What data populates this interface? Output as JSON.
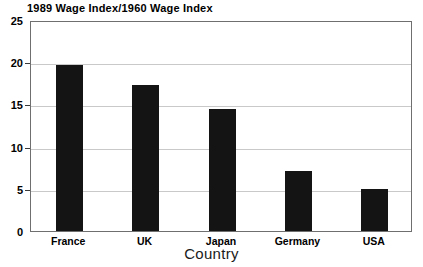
{
  "chart_data": {
    "type": "bar",
    "title": "1989 Wage Index/1960 Wage Index",
    "xlabel": "Country",
    "ylabel": "",
    "categories": [
      "France",
      "UK",
      "Japan",
      "Germany",
      "USA"
    ],
    "values": [
      19.7,
      17.3,
      14.4,
      7.1,
      5.0
    ],
    "ylim": [
      0,
      25
    ],
    "yticks": [
      0,
      5,
      10,
      15,
      20,
      25
    ],
    "ytick_labels": [
      "0",
      "5",
      "10",
      "15",
      "20",
      "25"
    ],
    "grid": true,
    "grid_axis": "y",
    "legend": null,
    "bar_color": "#141414",
    "grid_color": "#c9c9c9",
    "axis_color": "#6f6f6f",
    "background": "#ffffff"
  }
}
